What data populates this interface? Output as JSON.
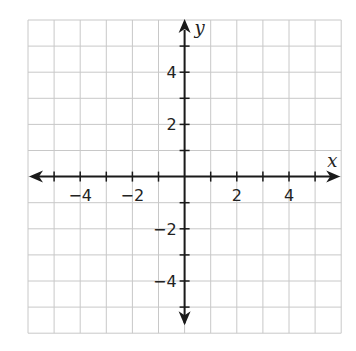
{
  "chart_data": {
    "type": "scatter",
    "title": "",
    "xlabel": "x",
    "ylabel": "y",
    "xlim": [
      -6,
      6
    ],
    "ylim": [
      -6,
      6
    ],
    "grid": true,
    "grid_step": 1,
    "x_tick_labels": [
      {
        "value": -4,
        "label": "−4"
      },
      {
        "value": -2,
        "label": "−2"
      },
      {
        "value": 2,
        "label": "2"
      },
      {
        "value": 4,
        "label": "4"
      }
    ],
    "y_tick_labels": [
      {
        "value": 4,
        "label": "4"
      },
      {
        "value": 2,
        "label": "2"
      },
      {
        "value": -2,
        "label": "−2"
      },
      {
        "value": -4,
        "label": "−4"
      }
    ],
    "series": [],
    "legend": null
  },
  "layout": {
    "grid_left": 28,
    "grid_top": 20,
    "unit_px": 26.1,
    "colors": {
      "grid": "#c8c8c8",
      "axis": "#1a1a1a",
      "text": "#222222"
    }
  }
}
